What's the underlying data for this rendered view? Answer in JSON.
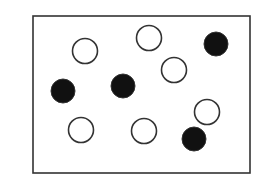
{
  "diagram": {
    "frame": {
      "x": 33,
      "y": 16,
      "width": 217,
      "height": 157,
      "stroke": "#333333",
      "stroke_width": 1.6
    },
    "circle_radius": 12.5,
    "open_color": "#ffffff",
    "filled_color": "#111111",
    "stroke_color": "#333333",
    "circles": [
      {
        "type": "open",
        "cx": 85,
        "cy": 51
      },
      {
        "type": "open",
        "cx": 149,
        "cy": 38
      },
      {
        "type": "filled",
        "cx": 216,
        "cy": 44
      },
      {
        "type": "open",
        "cx": 174,
        "cy": 70
      },
      {
        "type": "filled",
        "cx": 63,
        "cy": 91
      },
      {
        "type": "filled",
        "cx": 123,
        "cy": 86
      },
      {
        "type": "open",
        "cx": 207,
        "cy": 112
      },
      {
        "type": "open",
        "cx": 81,
        "cy": 130
      },
      {
        "type": "open",
        "cx": 144,
        "cy": 131
      },
      {
        "type": "filled",
        "cx": 194,
        "cy": 139
      }
    ],
    "counts": {
      "open": 6,
      "filled": 4
    }
  }
}
